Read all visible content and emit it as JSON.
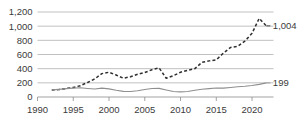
{
  "chart_data": {
    "type": "line",
    "title": "",
    "subtitle": "",
    "xlabel": "",
    "ylabel": "",
    "xlim": [
      1990,
      2023
    ],
    "ylim": [
      0,
      1200
    ],
    "grid": true,
    "legend": "none",
    "y_ticks": [
      0,
      200,
      400,
      600,
      800,
      1000,
      1200
    ],
    "y_tick_labels": [
      "0",
      "200",
      "400",
      "600",
      "800",
      "1,000",
      "1,200"
    ],
    "x_ticks": [
      1990,
      1995,
      2000,
      2005,
      2010,
      2015,
      2020
    ],
    "x_tick_labels": [
      "1990",
      "1995",
      "2000",
      "2005",
      "2010",
      "2015",
      "2020"
    ],
    "x": [
      1992,
      1993,
      1994,
      1995,
      1996,
      1997,
      1998,
      1999,
      2000,
      2001,
      2002,
      2003,
      2004,
      2005,
      2006,
      2007,
      2008,
      2009,
      2010,
      2011,
      2012,
      2013,
      2014,
      2015,
      2016,
      2017,
      2018,
      2019,
      2020,
      2021,
      2022
    ],
    "series": [
      {
        "name": "dashed-series",
        "style": "dashed",
        "color": "#2f2f2f",
        "end_label": "1,004",
        "values": [
          100,
          105,
          120,
          135,
          160,
          205,
          255,
          330,
          350,
          310,
          265,
          285,
          320,
          345,
          385,
          410,
          265,
          300,
          350,
          375,
          400,
          490,
          510,
          525,
          620,
          700,
          715,
          790,
          900,
          1110,
          1004
        ]
      },
      {
        "name": "solid-series",
        "style": "solid",
        "color": "#8f8f8f",
        "end_label": "199",
        "values": [
          100,
          108,
          118,
          125,
          130,
          120,
          112,
          125,
          115,
          95,
          80,
          78,
          88,
          105,
          120,
          122,
          100,
          78,
          72,
          78,
          95,
          110,
          118,
          128,
          125,
          135,
          145,
          152,
          162,
          178,
          199
        ]
      }
    ],
    "annotations": [
      {
        "name": "dashed-end-value",
        "text": "1,004",
        "value": 1004,
        "at_x": 2022
      },
      {
        "name": "solid-end-value",
        "text": "199",
        "value": 199,
        "at_x": 2022
      }
    ]
  }
}
